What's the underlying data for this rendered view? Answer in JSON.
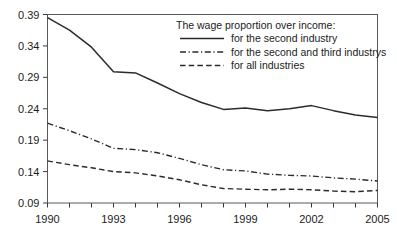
{
  "chart_data": {
    "type": "line",
    "title": "",
    "xlabel": "",
    "ylabel": "",
    "xlim": [
      1990,
      2005
    ],
    "ylim": [
      0.09,
      0.39
    ],
    "grid": false,
    "legend_position": "top-right",
    "legend_title": "The wage proportion over income:",
    "x": [
      1990,
      1991,
      1992,
      1993,
      1994,
      1995,
      1996,
      1997,
      1998,
      1999,
      2000,
      2001,
      2002,
      2003,
      2004,
      2005
    ],
    "xtick_labels": [
      "1990",
      "1993",
      "1996",
      "1999",
      "2002",
      "2005"
    ],
    "xtick_values": [
      1990,
      1993,
      1996,
      1999,
      2002,
      2005
    ],
    "xtick_all": [
      1990,
      1991,
      1992,
      1993,
      1994,
      1995,
      1996,
      1997,
      1998,
      1999,
      2000,
      2001,
      2002,
      2003,
      2004,
      2005
    ],
    "ytick_labels": [
      "0.09",
      "0.14",
      "0.19",
      "0.24",
      "0.29",
      "0.34",
      "0.39"
    ],
    "ytick_values": [
      0.09,
      0.14,
      0.19,
      0.24,
      0.29,
      0.34,
      0.39
    ],
    "series": [
      {
        "name": "for the second industry",
        "style": "solid",
        "color": "#2b2b2b",
        "values": [
          0.385,
          0.365,
          0.338,
          0.299,
          0.297,
          0.281,
          0.264,
          0.25,
          0.239,
          0.241,
          0.237,
          0.24,
          0.245,
          0.237,
          0.23,
          0.226
        ]
      },
      {
        "name": "for the second and third industrys",
        "style": "dash-dot",
        "color": "#2b2b2b",
        "values": [
          0.217,
          0.205,
          0.192,
          0.177,
          0.175,
          0.17,
          0.161,
          0.151,
          0.143,
          0.141,
          0.136,
          0.134,
          0.133,
          0.13,
          0.128,
          0.125
        ]
      },
      {
        "name": "for all industries",
        "style": "dashed",
        "color": "#2b2b2b",
        "values": [
          0.157,
          0.151,
          0.146,
          0.14,
          0.138,
          0.133,
          0.127,
          0.119,
          0.113,
          0.112,
          0.111,
          0.112,
          0.111,
          0.109,
          0.108,
          0.11
        ]
      }
    ]
  },
  "legend": {
    "title": "The wage proportion over income:",
    "entries": [
      {
        "label": "for the second industry",
        "style": "solid"
      },
      {
        "label": "for the second and third industrys",
        "style": "dash-dot"
      },
      {
        "label": "for all industries",
        "style": "dashed"
      }
    ]
  }
}
